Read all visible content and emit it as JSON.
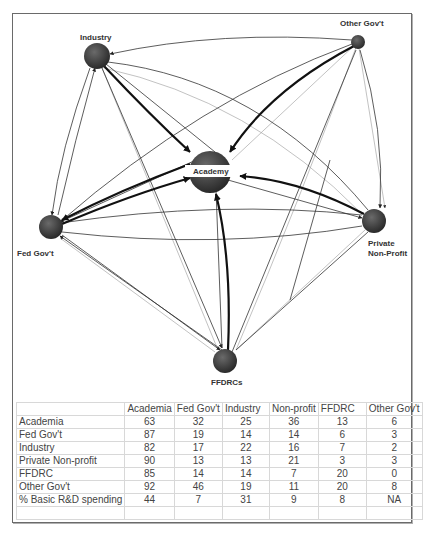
{
  "diagram": {
    "nodes": [
      {
        "id": "industry",
        "label": "Industry",
        "cx": 97,
        "cy": 56,
        "r": 13
      },
      {
        "id": "other_govt",
        "label": "Other Gov't",
        "cx": 358,
        "cy": 42,
        "r": 7
      },
      {
        "id": "academy",
        "label": "Academy",
        "cx": 210,
        "cy": 172,
        "r": 20
      },
      {
        "id": "fed_govt",
        "label": "Fed Gov't",
        "cx": 51,
        "cy": 227,
        "r": 12
      },
      {
        "id": "private_nonprofit",
        "label_line1": "Private",
        "label_line2": "Non-Profit",
        "cx": 374,
        "cy": 221,
        "r": 12
      },
      {
        "id": "ffdrcs",
        "label": "FFDRCs",
        "cx": 225,
        "cy": 361,
        "r": 12
      }
    ],
    "node_color": "#3a3a3a",
    "edge_color": "#222222"
  },
  "table": {
    "headers": [
      "",
      "Academia",
      "Fed Gov't",
      "Industry",
      "Non-profit",
      "FFDRC",
      "Other Gov't"
    ],
    "rows": [
      {
        "label": "Academia",
        "values": [
          "63",
          "32",
          "25",
          "36",
          "13",
          "6"
        ]
      },
      {
        "label": "Fed Gov't",
        "values": [
          "87",
          "19",
          "14",
          "14",
          "6",
          "3"
        ]
      },
      {
        "label": "Industry",
        "values": [
          "82",
          "17",
          "22",
          "16",
          "7",
          "2"
        ]
      },
      {
        "label": "Private Non-profit",
        "values": [
          "90",
          "13",
          "13",
          "21",
          "3",
          "3"
        ]
      },
      {
        "label": "FFDRC",
        "values": [
          "85",
          "14",
          "14",
          "7",
          "20",
          "0"
        ]
      },
      {
        "label": "Other Gov't",
        "values": [
          "92",
          "46",
          "19",
          "11",
          "20",
          "8"
        ]
      },
      {
        "label": "% Basic R&D spending",
        "values": [
          "44",
          "7",
          "31",
          "9",
          "8",
          "NA"
        ]
      }
    ]
  }
}
